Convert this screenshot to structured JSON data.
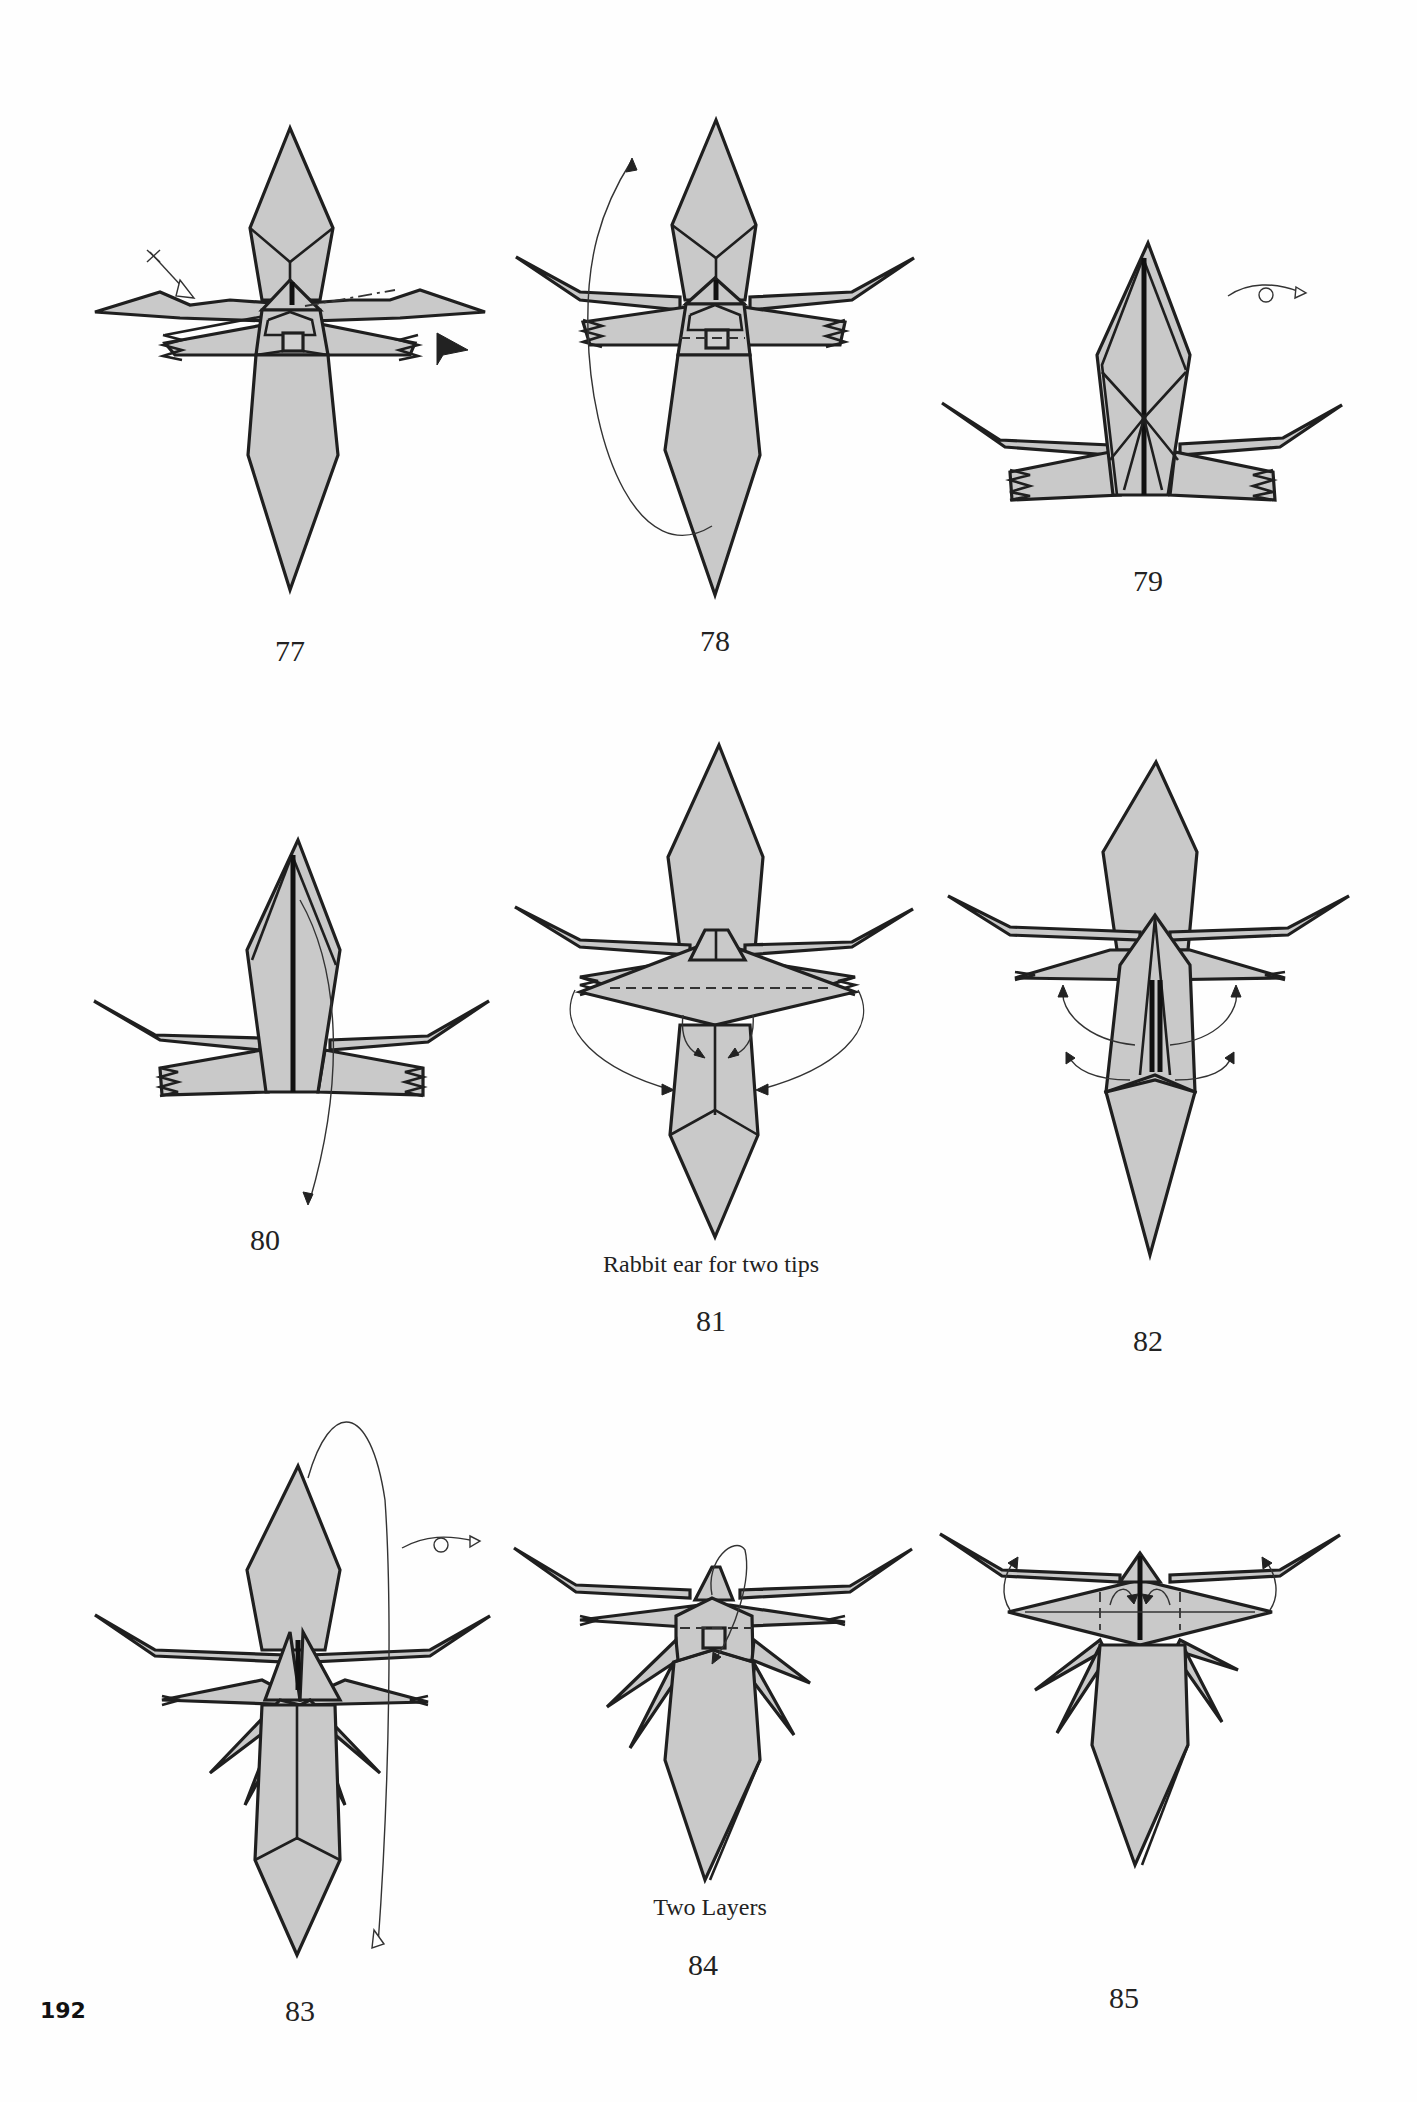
{
  "page": {
    "number": "192",
    "fill_color": "#c9c9c9",
    "stroke_color": "#1f1f1f"
  },
  "steps": [
    {
      "number": "77",
      "caption": "",
      "symbols": [
        "valley-fold-arrow",
        "sink-push-arrow",
        "mountain-fold-line"
      ]
    },
    {
      "number": "78",
      "caption": "",
      "symbols": [
        "fold-behind-arrow"
      ]
    },
    {
      "number": "79",
      "caption": "",
      "symbols": [
        "turn-over-icon"
      ]
    },
    {
      "number": "80",
      "caption": "",
      "symbols": [
        "fold-down-arrow"
      ]
    },
    {
      "number": "81",
      "caption": "Rabbit ear for two tips",
      "symbols": [
        "rabbit-ear-arrows"
      ]
    },
    {
      "number": "82",
      "caption": "",
      "symbols": [
        "swing-out-arrows"
      ]
    },
    {
      "number": "83",
      "caption": "",
      "symbols": [
        "turn-over-icon",
        "fold-behind-arrow"
      ]
    },
    {
      "number": "84",
      "caption": "Two Layers",
      "symbols": [
        "fold-down-arrow"
      ]
    },
    {
      "number": "85",
      "caption": "",
      "symbols": [
        "swing-arrows"
      ]
    }
  ]
}
